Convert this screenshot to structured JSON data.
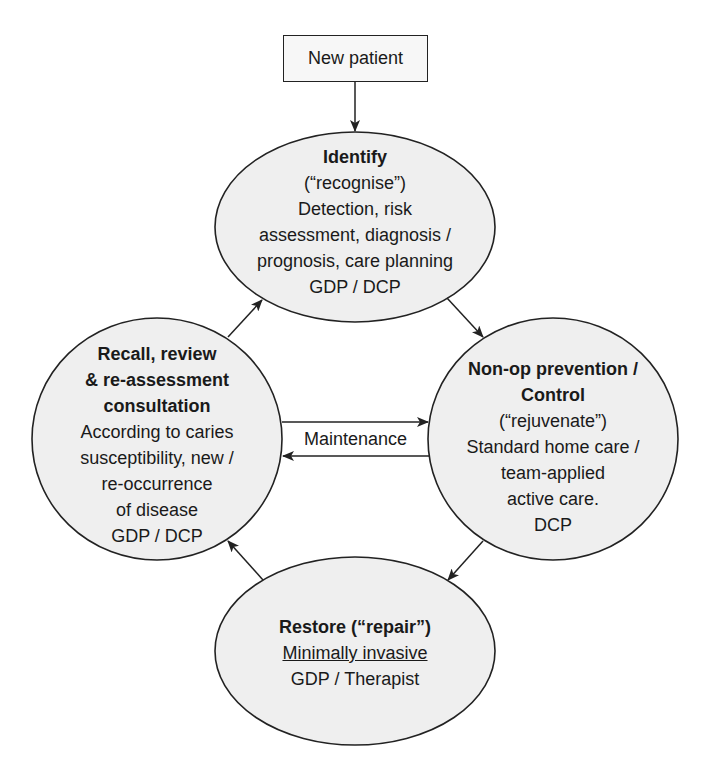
{
  "diagram": {
    "start": {
      "label": "New patient"
    },
    "nodes": {
      "identify": {
        "title_lines": [
          "Identify",
          "(“recognise”)"
        ],
        "body_lines": [
          "Detection, risk",
          "assessment, diagnosis /",
          "prognosis, care planning",
          "GDP / DCP"
        ]
      },
      "prevention": {
        "title_lines": [
          "Non-op prevention /",
          "Control",
          "(“rejuvenate”)"
        ],
        "body_lines": [
          "Standard home care /",
          "team-applied",
          "active care.",
          "DCP"
        ]
      },
      "restore": {
        "title_lines": [
          "Restore (“repair”)"
        ],
        "underlined_line": "Minimally invasive",
        "body_lines": [
          "GDP / Therapist"
        ]
      },
      "recall": {
        "title_lines": [
          "Recall, review",
          "& re-assessment",
          "consultation"
        ],
        "body_lines": [
          "According to caries",
          "susceptibility, new /",
          "re-occurrence",
          "of disease",
          "GDP / DCP"
        ]
      }
    },
    "edges": {
      "maintenance_label": "Maintenance"
    },
    "colors": {
      "node_fill": "#efefef",
      "stroke": "#222222",
      "background": "#ffffff"
    }
  }
}
